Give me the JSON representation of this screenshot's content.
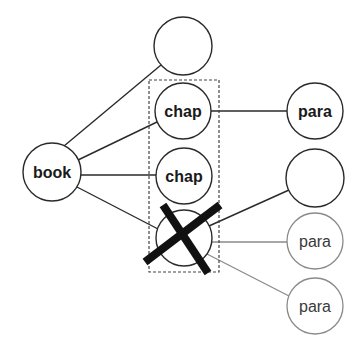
{
  "diagram": {
    "type": "tree",
    "colors": {
      "stroke_dark": "#2a2a2a",
      "stroke_faded": "#8a8a8a",
      "cross": "#111111",
      "background": "#ffffff"
    },
    "nodes": [
      {
        "id": "book",
        "label": "book",
        "cx": 52,
        "cy": 172,
        "r": 29,
        "style": "bold"
      },
      {
        "id": "chap-empty-top",
        "label": "",
        "cx": 183,
        "cy": 46,
        "r": 29,
        "style": "bold"
      },
      {
        "id": "chap-1",
        "label": "chap",
        "cx": 183,
        "cy": 111,
        "r": 28,
        "style": "bold"
      },
      {
        "id": "chap-2",
        "label": "chap",
        "cx": 184,
        "cy": 176,
        "r": 28,
        "style": "bold"
      },
      {
        "id": "chap-deleted",
        "label": "",
        "cx": 184,
        "cy": 238,
        "r": 28,
        "style": "bold",
        "deleted": true
      },
      {
        "id": "para-1",
        "label": "para",
        "cx": 315,
        "cy": 111,
        "r": 28,
        "style": "bold"
      },
      {
        "id": "para-empty",
        "label": "",
        "cx": 315,
        "cy": 178,
        "r": 29,
        "style": "bold"
      },
      {
        "id": "para-2",
        "label": "para",
        "cx": 315,
        "cy": 241,
        "r": 28,
        "style": "faded"
      },
      {
        "id": "para-3",
        "label": "para",
        "cx": 315,
        "cy": 306,
        "r": 28,
        "style": "faded"
      }
    ],
    "edges": [
      {
        "from": "book",
        "to": "chap-empty-top",
        "style": "dark"
      },
      {
        "from": "book",
        "to": "chap-1",
        "style": "dark"
      },
      {
        "from": "book",
        "to": "chap-2",
        "style": "dark"
      },
      {
        "from": "book",
        "to": "chap-deleted",
        "style": "dark"
      },
      {
        "from": "chap-1",
        "to": "para-1",
        "style": "dark"
      },
      {
        "from": "chap-deleted",
        "to": "para-empty",
        "style": "dark"
      },
      {
        "from": "chap-deleted",
        "to": "para-2",
        "style": "faded"
      },
      {
        "from": "chap-deleted",
        "to": "para-3",
        "style": "faded"
      }
    ],
    "selection_box": {
      "x": 149,
      "y": 80,
      "width": 70,
      "height": 192,
      "style": "dashed"
    },
    "cross_mark": {
      "target": "chap-deleted",
      "line1": {
        "x1": 163,
        "y1": 205,
        "x2": 208,
        "y2": 273
      },
      "line2": {
        "x1": 220,
        "y1": 205,
        "x2": 145,
        "y2": 262
      }
    }
  }
}
